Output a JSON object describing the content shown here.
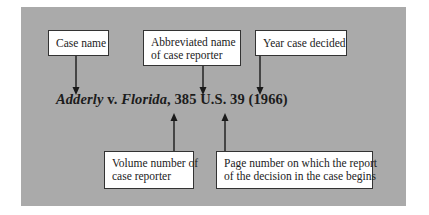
{
  "citation": {
    "case_name_part1": "Adderly",
    "versus": " v. ",
    "case_name_part2": "Florida",
    "rest": ", 385 U.S. 39 (1966)"
  },
  "labels": {
    "case_name": "Case name",
    "reporter_line1": "Abbreviated name",
    "reporter_line2": "of case reporter",
    "year": "Year case decided",
    "volume_line1": "Volume number of",
    "volume_line2": "case reporter",
    "page_line1": "Page number on which the report",
    "page_line2": "of the decision in the case begins"
  },
  "colors": {
    "panel": "#aaaaaa",
    "box": "#ffffff",
    "arrow": "#1a1a1a"
  }
}
